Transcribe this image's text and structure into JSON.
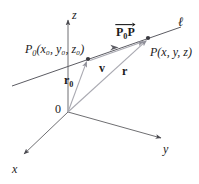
{
  "figure": {
    "width": 199,
    "height": 184,
    "background": "#ffffff",
    "ink_color": "#1b1b1b",
    "axis_color": "#6f6f72",
    "line_color": "#63636a",
    "vector_color": "#9a9aa2"
  },
  "labels": {
    "z_axis": "z",
    "x_axis": "x",
    "y_axis": "y",
    "origin": "0",
    "line": "ℓ",
    "point_p0_name": "P",
    "point_p0_sub": "0",
    "point_p0_coords": "(x₀, y₀, z₀)",
    "point_p_name": "P",
    "point_p_coords": "(x, y, z)",
    "vector_p0p_first": "P",
    "vector_p0p_sub": "0",
    "vector_p0p_second": "P",
    "vector_v": "v",
    "vector_r0_name": "r",
    "vector_r0_sub": "0",
    "vector_r": "r"
  },
  "geometry": {
    "origin": [
      68,
      112
    ],
    "z_axis_tip": [
      68,
      18
    ],
    "x_axis_tip": [
      22,
      156
    ],
    "y_axis_tip": [
      163,
      139
    ],
    "line_start": [
      12,
      86
    ],
    "line_end": [
      182,
      27
    ],
    "point_p0": [
      88,
      59
    ],
    "point_p": [
      148,
      38
    ],
    "v_arrow_tip": [
      117,
      48
    ],
    "p0p_arrow_tip": [
      143,
      40
    ]
  },
  "elements": [
    {
      "name": "z-axis",
      "type": "axis",
      "label": "z"
    },
    {
      "name": "x-axis",
      "type": "axis",
      "label": "x"
    },
    {
      "name": "y-axis",
      "type": "axis",
      "label": "y"
    },
    {
      "name": "line-ell",
      "type": "line",
      "label": "ℓ"
    },
    {
      "name": "vector-r0",
      "type": "vector",
      "label": "r0",
      "from": "origin",
      "to": "P0"
    },
    {
      "name": "vector-r",
      "type": "vector",
      "label": "r",
      "from": "origin",
      "to": "P"
    },
    {
      "name": "vector-v",
      "type": "vector",
      "label": "v",
      "from": "P0",
      "to": "along line"
    },
    {
      "name": "vector-p0p",
      "type": "vector",
      "label": "P0P",
      "from": "P0",
      "to": "P"
    }
  ]
}
